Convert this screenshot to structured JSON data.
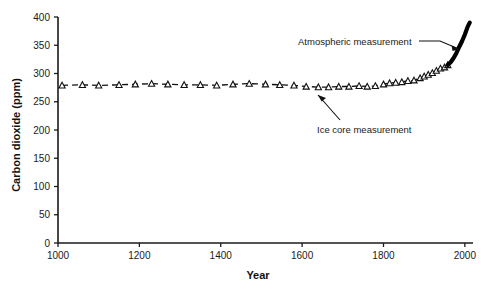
{
  "chart_data": {
    "type": "line",
    "title": "",
    "xlabel": "Year",
    "ylabel": "Carbon dioxide (ppm)",
    "xlim": [
      1000,
      2020
    ],
    "ylim": [
      0,
      400
    ],
    "xticks": [
      1000,
      1200,
      1400,
      1600,
      1800,
      2000
    ],
    "yticks": [
      0,
      50,
      100,
      150,
      200,
      250,
      300,
      350,
      400
    ],
    "grid": false,
    "legend_position": "none",
    "annotations": [
      {
        "text": "Atmospheric measurement",
        "target": "atmospheric-series"
      },
      {
        "text": "Ice core measurement",
        "target": "ice-core-series"
      }
    ],
    "series": [
      {
        "name": "Ice core measurement",
        "style": "dashed-line-with-open-triangle-markers",
        "color": "#111111",
        "marker": "open-triangle",
        "x": [
          1010,
          1060,
          1100,
          1150,
          1190,
          1230,
          1270,
          1310,
          1350,
          1390,
          1430,
          1470,
          1510,
          1545,
          1580,
          1610,
          1640,
          1665,
          1690,
          1715,
          1740,
          1760,
          1780,
          1800,
          1815,
          1830,
          1845,
          1860,
          1875,
          1890,
          1900,
          1910,
          1920,
          1930,
          1940,
          1950,
          1958
        ],
        "y": [
          279,
          280,
          279,
          280,
          281,
          282,
          281,
          280,
          280,
          279,
          281,
          282,
          281,
          280,
          279,
          277,
          276,
          276,
          277,
          277,
          278,
          277,
          278,
          281,
          283,
          284,
          285,
          287,
          288,
          292,
          295,
          298,
          301,
          305,
          309,
          311,
          315
        ]
      },
      {
        "name": "Atmospheric measurement",
        "style": "thick-solid-line",
        "color": "#000000",
        "marker": "none",
        "x": [
          1958,
          1965,
          1972,
          1979,
          1986,
          1993,
          2000,
          2007,
          2012
        ],
        "y": [
          315,
          320,
          327,
          336,
          347,
          357,
          369,
          383,
          390
        ]
      }
    ]
  },
  "axes": {
    "y_tick_labels": [
      "0",
      "50",
      "100",
      "150",
      "200",
      "250",
      "300",
      "350",
      "400"
    ],
    "x_tick_labels": [
      "1000",
      "1200",
      "1400",
      "1600",
      "1800",
      "2000"
    ]
  }
}
